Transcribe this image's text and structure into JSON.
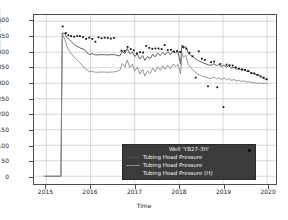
{
  "chart_data": {
    "type": "line",
    "title": "",
    "xlabel": "Time",
    "ylabel": "Pressure, Barsa",
    "xlim": [
      2014.72,
      2020.2
    ],
    "ylim": [
      -25,
      520
    ],
    "grid": true,
    "xticks": [
      "2015",
      "2016",
      "2017",
      "2018",
      "2019",
      "2020"
    ],
    "xtick_values": [
      2015,
      2016,
      2017,
      2018,
      2019,
      2020
    ],
    "yticks": [
      "0",
      "50",
      "100",
      "150",
      "200",
      "250",
      "300",
      "350",
      "400",
      "450",
      "500"
    ],
    "ytick_values": [
      0,
      50,
      100,
      150,
      200,
      250,
      300,
      350,
      400,
      450,
      500
    ],
    "legend": {
      "title": "Well 'YB27-3H'",
      "position": "lower-right",
      "background": "#3b3b3b",
      "text_color": "#f2f2f2",
      "entries": [
        {
          "label": "Tubing Head Pressure",
          "color": "#4d4d4d",
          "style": "line"
        },
        {
          "label": "Tubing Head Pressure",
          "color": "#8c8c8c",
          "style": "line"
        },
        {
          "label": "Tubing Head Pressure (H)",
          "color": "#111111",
          "style": "marker"
        }
      ]
    },
    "series": [
      {
        "name": "Tubing Head Pressure",
        "color": "#4d4d4d",
        "style": "line",
        "points": [
          [
            2014.95,
            0
          ],
          [
            2015.05,
            0
          ],
          [
            2015.15,
            0
          ],
          [
            2015.25,
            0
          ],
          [
            2015.33,
            0
          ],
          [
            2015.36,
            462
          ],
          [
            2015.42,
            460
          ],
          [
            2015.46,
            448
          ],
          [
            2015.52,
            441
          ],
          [
            2015.58,
            432
          ],
          [
            2015.63,
            424
          ],
          [
            2015.69,
            419
          ],
          [
            2015.75,
            415
          ],
          [
            2015.81,
            411
          ],
          [
            2015.86,
            409
          ],
          [
            2015.92,
            400
          ],
          [
            2015.97,
            392
          ],
          [
            2016.03,
            396
          ],
          [
            2016.09,
            392
          ],
          [
            2016.14,
            391
          ],
          [
            2016.2,
            392
          ],
          [
            2016.26,
            392
          ],
          [
            2016.32,
            392
          ],
          [
            2016.37,
            391
          ],
          [
            2016.43,
            392
          ],
          [
            2016.49,
            392
          ],
          [
            2016.55,
            392
          ],
          [
            2016.6,
            390
          ],
          [
            2016.66,
            388
          ],
          [
            2016.72,
            402
          ],
          [
            2016.78,
            396
          ],
          [
            2016.83,
            412
          ],
          [
            2016.89,
            395
          ],
          [
            2016.95,
            401
          ],
          [
            2017.0,
            386
          ],
          [
            2017.06,
            394
          ],
          [
            2017.12,
            378
          ],
          [
            2017.18,
            389
          ],
          [
            2017.23,
            374
          ],
          [
            2017.29,
            386
          ],
          [
            2017.35,
            380
          ],
          [
            2017.41,
            393
          ],
          [
            2017.46,
            385
          ],
          [
            2017.52,
            397
          ],
          [
            2017.58,
            389
          ],
          [
            2017.64,
            399
          ],
          [
            2017.69,
            391
          ],
          [
            2017.75,
            401
          ],
          [
            2017.81,
            392
          ],
          [
            2017.87,
            404
          ],
          [
            2017.92,
            398
          ],
          [
            2017.98,
            402
          ],
          [
            2018.04,
            361
          ],
          [
            2018.07,
            423
          ],
          [
            2018.1,
            413
          ],
          [
            2018.16,
            418
          ],
          [
            2018.21,
            398
          ],
          [
            2018.27,
            390
          ],
          [
            2018.33,
            384
          ],
          [
            2018.39,
            377
          ],
          [
            2018.44,
            373
          ],
          [
            2018.5,
            369
          ],
          [
            2018.56,
            365
          ],
          [
            2018.62,
            362
          ],
          [
            2018.67,
            359
          ],
          [
            2018.73,
            358
          ],
          [
            2018.79,
            363
          ],
          [
            2018.85,
            357
          ],
          [
            2018.9,
            360
          ],
          [
            2018.96,
            354
          ],
          [
            2019.02,
            358
          ],
          [
            2019.08,
            352
          ],
          [
            2019.13,
            356
          ],
          [
            2019.19,
            349
          ],
          [
            2019.25,
            351
          ],
          [
            2019.31,
            345
          ],
          [
            2019.36,
            348
          ],
          [
            2019.42,
            341
          ],
          [
            2019.48,
            344
          ],
          [
            2019.54,
            337
          ],
          [
            2019.59,
            339
          ],
          [
            2019.65,
            331
          ],
          [
            2019.71,
            333
          ],
          [
            2019.77,
            325
          ],
          [
            2019.82,
            327
          ],
          [
            2019.88,
            318
          ],
          [
            2019.94,
            314
          ],
          [
            2020.0,
            311
          ]
        ]
      },
      {
        "name": "Tubing Head Pressure",
        "color": "#8c8c8c",
        "style": "line",
        "points": [
          [
            2014.95,
            0
          ],
          [
            2015.05,
            0
          ],
          [
            2015.15,
            0
          ],
          [
            2015.25,
            0
          ],
          [
            2015.33,
            0
          ],
          [
            2015.36,
            460
          ],
          [
            2015.42,
            440
          ],
          [
            2015.46,
            420
          ],
          [
            2015.52,
            404
          ],
          [
            2015.58,
            392
          ],
          [
            2015.63,
            384
          ],
          [
            2015.69,
            376
          ],
          [
            2015.75,
            368
          ],
          [
            2015.81,
            358
          ],
          [
            2015.86,
            348
          ],
          [
            2015.92,
            343
          ],
          [
            2015.97,
            337
          ],
          [
            2016.03,
            339
          ],
          [
            2016.09,
            336
          ],
          [
            2016.14,
            335
          ],
          [
            2016.2,
            336
          ],
          [
            2016.26,
            336
          ],
          [
            2016.32,
            336
          ],
          [
            2016.37,
            335
          ],
          [
            2016.43,
            336
          ],
          [
            2016.49,
            336
          ],
          [
            2016.55,
            337
          ],
          [
            2016.6,
            339
          ],
          [
            2016.66,
            341
          ],
          [
            2016.72,
            364
          ],
          [
            2016.78,
            352
          ],
          [
            2016.83,
            375
          ],
          [
            2016.89,
            350
          ],
          [
            2016.95,
            362
          ],
          [
            2017.0,
            339
          ],
          [
            2017.06,
            352
          ],
          [
            2017.12,
            329
          ],
          [
            2017.18,
            345
          ],
          [
            2017.23,
            323
          ],
          [
            2017.29,
            340
          ],
          [
            2017.35,
            331
          ],
          [
            2017.41,
            349
          ],
          [
            2017.46,
            337
          ],
          [
            2017.52,
            353
          ],
          [
            2017.58,
            342
          ],
          [
            2017.64,
            356
          ],
          [
            2017.69,
            345
          ],
          [
            2017.75,
            359
          ],
          [
            2017.81,
            347
          ],
          [
            2017.87,
            362
          ],
          [
            2017.92,
            354
          ],
          [
            2017.98,
            360
          ],
          [
            2018.04,
            330
          ],
          [
            2018.07,
            398
          ],
          [
            2018.1,
            384
          ],
          [
            2018.16,
            390
          ],
          [
            2018.21,
            362
          ],
          [
            2018.27,
            350
          ],
          [
            2018.33,
            341
          ],
          [
            2018.39,
            334
          ],
          [
            2018.44,
            329
          ],
          [
            2018.5,
            325
          ],
          [
            2018.56,
            321
          ],
          [
            2018.62,
            319
          ],
          [
            2018.67,
            316
          ],
          [
            2018.73,
            315
          ],
          [
            2018.79,
            321
          ],
          [
            2018.85,
            314
          ],
          [
            2018.9,
            318
          ],
          [
            2018.96,
            312
          ],
          [
            2019.02,
            317
          ],
          [
            2019.08,
            311
          ],
          [
            2019.13,
            315
          ],
          [
            2019.19,
            309
          ],
          [
            2019.25,
            312
          ],
          [
            2019.31,
            307
          ],
          [
            2019.36,
            310
          ],
          [
            2019.42,
            305
          ],
          [
            2019.48,
            308
          ],
          [
            2019.54,
            303
          ],
          [
            2019.59,
            305
          ],
          [
            2019.65,
            301
          ],
          [
            2019.71,
            303
          ],
          [
            2019.77,
            299
          ],
          [
            2019.82,
            301
          ],
          [
            2019.88,
            299
          ],
          [
            2019.94,
            299
          ],
          [
            2020.0,
            300
          ]
        ]
      },
      {
        "name": "Tubing Head Pressure (H)",
        "color": "#111111",
        "style": "marker",
        "points": [
          [
            2015.37,
            483
          ],
          [
            2015.44,
            462
          ],
          [
            2015.5,
            455
          ],
          [
            2015.56,
            452
          ],
          [
            2015.63,
            450
          ],
          [
            2015.7,
            452
          ],
          [
            2015.76,
            452
          ],
          [
            2015.83,
            449
          ],
          [
            2015.9,
            443
          ],
          [
            2015.97,
            447
          ],
          [
            2016.04,
            443
          ],
          [
            2016.11,
            434
          ],
          [
            2016.18,
            448
          ],
          [
            2016.25,
            445
          ],
          [
            2016.32,
            447
          ],
          [
            2016.39,
            446
          ],
          [
            2016.46,
            444
          ],
          [
            2016.53,
            446
          ],
          [
            2016.7,
            405
          ],
          [
            2016.77,
            404
          ],
          [
            2016.84,
            417
          ],
          [
            2016.91,
            410
          ],
          [
            2016.98,
            406
          ],
          [
            2017.05,
            396
          ],
          [
            2017.12,
            400
          ],
          [
            2017.19,
            399
          ],
          [
            2017.26,
            420
          ],
          [
            2017.33,
            414
          ],
          [
            2017.4,
            411
          ],
          [
            2017.47,
            412
          ],
          [
            2017.54,
            412
          ],
          [
            2017.61,
            410
          ],
          [
            2017.68,
            423
          ],
          [
            2017.75,
            407
          ],
          [
            2017.82,
            408
          ],
          [
            2017.89,
            402
          ],
          [
            2017.96,
            404
          ],
          [
            2018.03,
            401
          ],
          [
            2018.1,
            417
          ],
          [
            2018.17,
            411
          ],
          [
            2018.24,
            398
          ],
          [
            2018.31,
            387
          ],
          [
            2018.38,
            318
          ],
          [
            2018.45,
            403
          ],
          [
            2018.52,
            379
          ],
          [
            2018.59,
            375
          ],
          [
            2018.66,
            290
          ],
          [
            2018.73,
            368
          ],
          [
            2018.8,
            370
          ],
          [
            2018.87,
            287
          ],
          [
            2018.94,
            362
          ],
          [
            2019.01,
            223
          ],
          [
            2019.08,
            360
          ],
          [
            2019.15,
            358
          ],
          [
            2019.22,
            357
          ],
          [
            2019.29,
            351
          ],
          [
            2019.36,
            347
          ],
          [
            2019.43,
            345
          ],
          [
            2019.5,
            343
          ],
          [
            2019.57,
            340
          ],
          [
            2019.64,
            333
          ],
          [
            2019.71,
            331
          ],
          [
            2019.78,
            327
          ],
          [
            2019.85,
            322
          ],
          [
            2019.92,
            318
          ],
          [
            2019.99,
            313
          ]
        ]
      }
    ]
  }
}
